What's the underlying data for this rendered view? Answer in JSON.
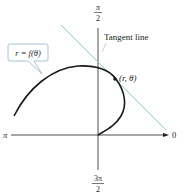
{
  "diagram": {
    "type": "polar-graph",
    "axes": {
      "top_label": {
        "num": "π",
        "den": "2"
      },
      "bottom_label": {
        "num": "3π",
        "den": "2"
      },
      "left_label": "π",
      "right_label": "0"
    },
    "curve_label": "r = f(θ)",
    "tangent_label": "Tangent line",
    "point_label": "(r, θ)",
    "colors": {
      "axis": "#231f20",
      "curve": "#1a1a1a",
      "tangent": "#8fc6d6",
      "callout_border": "#8fb3c4",
      "text": "#231f20"
    }
  }
}
